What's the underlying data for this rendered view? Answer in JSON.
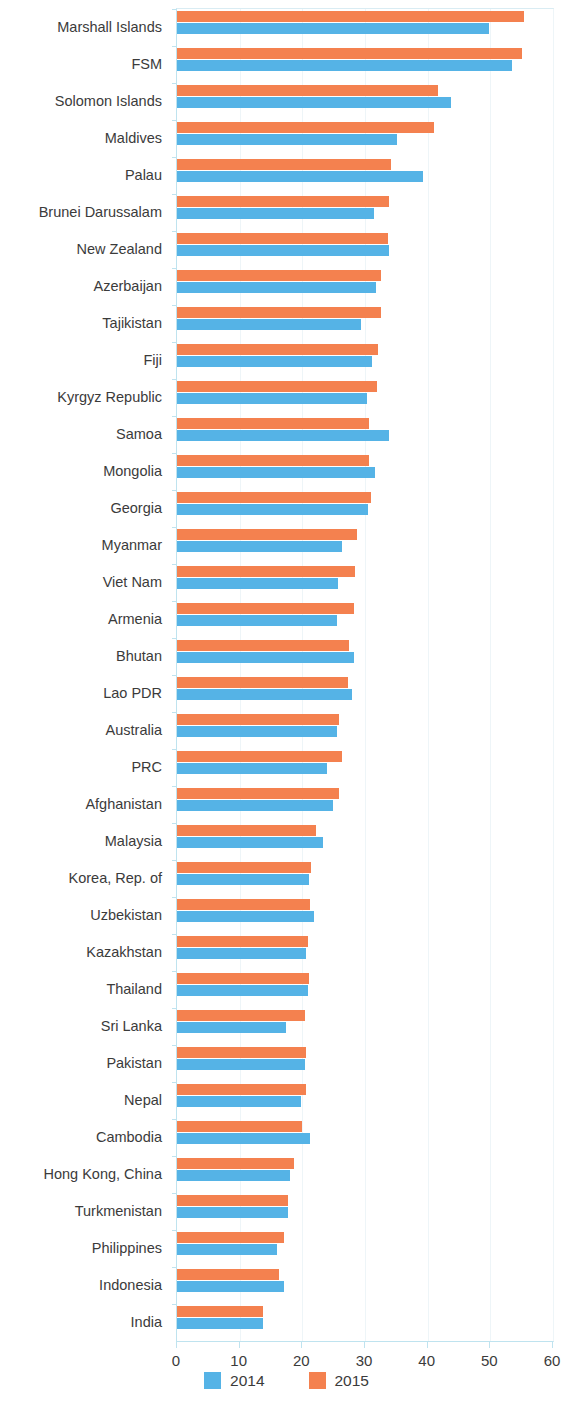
{
  "chart_data": {
    "type": "bar",
    "orientation": "horizontal",
    "title": "",
    "subtitle": "",
    "xlabel": "",
    "ylabel": "",
    "xlim": [
      0,
      60
    ],
    "xticks": [
      0,
      10,
      20,
      30,
      40,
      50,
      60
    ],
    "grid": true,
    "grid_axis": "x",
    "legend_position": "bottom",
    "categories": [
      "Marshall Islands",
      "FSM",
      "Solomon Islands",
      "Maldives",
      "Palau",
      "Brunei Darussalam",
      "New Zealand",
      "Azerbaijan",
      "Tajikistan",
      "Fiji",
      "Kyrgyz Republic",
      "Samoa",
      "Mongolia",
      "Georgia",
      "Myanmar",
      "Viet Nam",
      "Armenia",
      "Bhutan",
      "Lao PDR",
      "Australia",
      "PRC",
      "Afghanistan",
      "Malaysia",
      "Korea, Rep. of",
      "Uzbekistan",
      "Kazakhstan",
      "Thailand",
      "Sri Lanka",
      "Pakistan",
      "Nepal",
      "Cambodia",
      "Hong Kong, China",
      "Turkmenistan",
      "Philippines",
      "Indonesia",
      "India"
    ],
    "series": [
      {
        "name": "2014",
        "color": "#55b3e6",
        "values": [
          49.8,
          53.5,
          43.7,
          35.1,
          39.3,
          31.5,
          33.9,
          31.7,
          29.3,
          31.1,
          30.3,
          33.9,
          31.6,
          30.5,
          26.4,
          25.7,
          25.5,
          28.3,
          28.0,
          25.5,
          23.9,
          24.9,
          23.3,
          21.1,
          21.8,
          20.6,
          20.9,
          17.4,
          20.4,
          19.8,
          21.3,
          18.1,
          17.7,
          16.0,
          17.0,
          13.7
        ]
      },
      {
        "name": "2015",
        "color": "#f4814f",
        "values": [
          55.3,
          55.1,
          41.6,
          41.0,
          34.2,
          33.9,
          33.6,
          32.5,
          32.5,
          32.0,
          31.9,
          30.7,
          30.7,
          30.9,
          28.7,
          28.4,
          28.2,
          27.5,
          27.3,
          25.9,
          26.3,
          25.9,
          22.2,
          21.4,
          21.2,
          20.9,
          21.1,
          20.5,
          20.6,
          20.6,
          20.0,
          18.6,
          17.7,
          17.0,
          16.3,
          13.7
        ]
      }
    ]
  },
  "legend": {
    "items": [
      {
        "label": "2014",
        "swatch": "2014"
      },
      {
        "label": "2015",
        "swatch": "2015"
      }
    ]
  },
  "axis": {
    "x_tick_labels": [
      "0",
      "10",
      "20",
      "30",
      "40",
      "50",
      "60"
    ]
  }
}
